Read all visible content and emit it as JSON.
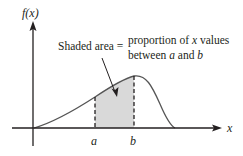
{
  "diagram": {
    "y_axis_label": "f(x)",
    "x_axis_label": "x",
    "point_a": "a",
    "point_b": "b",
    "annotation": {
      "left": "Shaded area =",
      "line1_pre": "proportion of ",
      "line1_var": "x",
      "line1_post": " values",
      "line2_pre": "between ",
      "line2_a": "a",
      "line2_mid": " and ",
      "line2_b": "b"
    },
    "colors": {
      "ink": "#231f20",
      "curve": "#555555",
      "shade": "#d9d9d9"
    }
  }
}
